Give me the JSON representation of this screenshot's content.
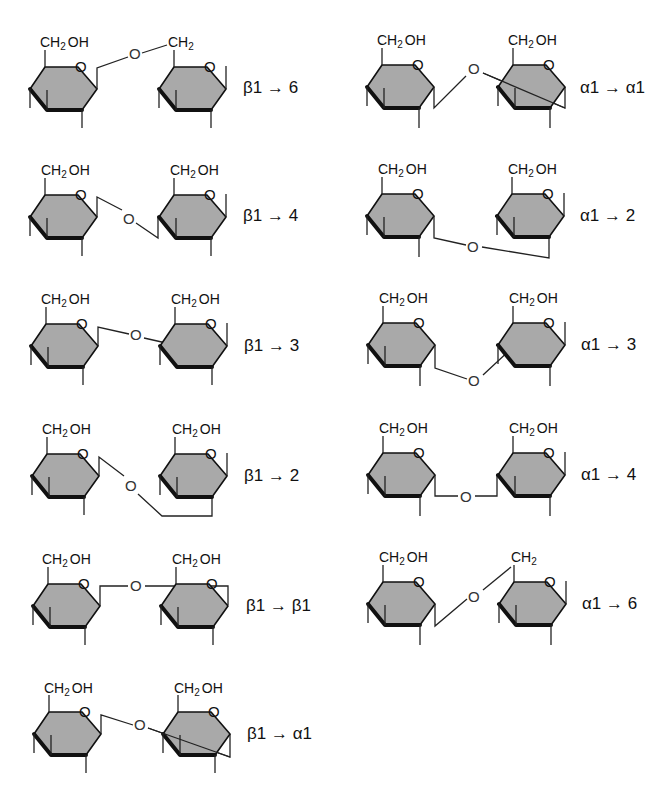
{
  "figure": {
    "type": "glycosidic-linkage-diagram",
    "ring_fill_color": "#a9a9a9",
    "line_color": "#111111",
    "group_labels": {
      "ch2oh_main": "CH",
      "ch2oh_sub": "2",
      "ch2oh_tail": "OH",
      "ch2_main": "CH",
      "ch2_sub": "2",
      "ring_oxygen": "O",
      "bridge_oxygen": "O"
    },
    "panels": [
      {
        "id": "beta1-6",
        "column": "left",
        "row": 0,
        "linkage": "β1 → 6",
        "anomer": "β",
        "from_carbon": 1,
        "to_position": "6"
      },
      {
        "id": "beta1-4",
        "column": "left",
        "row": 1,
        "linkage": "β1 → 4",
        "anomer": "β",
        "from_carbon": 1,
        "to_position": "4"
      },
      {
        "id": "beta1-3",
        "column": "left",
        "row": 2,
        "linkage": "β1 → 3",
        "anomer": "β",
        "from_carbon": 1,
        "to_position": "3"
      },
      {
        "id": "beta1-2",
        "column": "left",
        "row": 3,
        "linkage": "β1 → 2",
        "anomer": "β",
        "from_carbon": 1,
        "to_position": "2"
      },
      {
        "id": "beta1-beta1",
        "column": "left",
        "row": 4,
        "linkage": "β1 → β1",
        "anomer": "β",
        "from_carbon": 1,
        "to_position": "β1"
      },
      {
        "id": "beta1-alpha1",
        "column": "left",
        "row": 5,
        "linkage": "β1 → α1",
        "anomer": "β",
        "from_carbon": 1,
        "to_position": "α1"
      },
      {
        "id": "alpha1-alpha1",
        "column": "right",
        "row": 0,
        "linkage": "α1 → α1",
        "anomer": "α",
        "from_carbon": 1,
        "to_position": "α1"
      },
      {
        "id": "alpha1-2",
        "column": "right",
        "row": 1,
        "linkage": "α1 → 2",
        "anomer": "α",
        "from_carbon": 1,
        "to_position": "2"
      },
      {
        "id": "alpha1-3",
        "column": "right",
        "row": 2,
        "linkage": "α1 → 3",
        "anomer": "α",
        "from_carbon": 1,
        "to_position": "3"
      },
      {
        "id": "alpha1-4",
        "column": "right",
        "row": 3,
        "linkage": "α1 → 4",
        "anomer": "α",
        "from_carbon": 1,
        "to_position": "4"
      },
      {
        "id": "alpha1-6",
        "column": "right",
        "row": 4,
        "linkage": "α1 → 6",
        "anomer": "α",
        "from_carbon": 1,
        "to_position": "6"
      }
    ]
  }
}
